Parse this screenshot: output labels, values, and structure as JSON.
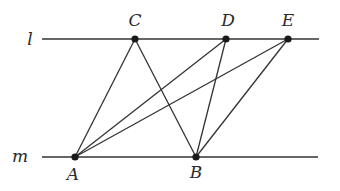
{
  "diagram": {
    "type": "geometry",
    "colors": {
      "stroke": "#333333",
      "point": "#1a1a1a",
      "label": "#2a2a2a",
      "background": "#ffffff"
    },
    "lines": [
      {
        "name": "l",
        "label": "l",
        "x1": 42,
        "y1": 39,
        "x2": 319,
        "y2": 39,
        "label_x": 30,
        "label_y": 45
      },
      {
        "name": "m",
        "label": "m",
        "x1": 42,
        "y1": 157,
        "x2": 318,
        "y2": 157,
        "label_x": 20,
        "label_y": 162
      }
    ],
    "points": [
      {
        "name": "C",
        "label": "C",
        "x": 135,
        "y": 39,
        "label_x": 135,
        "label_y": 26
      },
      {
        "name": "D",
        "label": "D",
        "x": 226,
        "y": 39,
        "label_x": 228,
        "label_y": 26
      },
      {
        "name": "E",
        "label": "E",
        "x": 288,
        "y": 39,
        "label_x": 288,
        "label_y": 26
      },
      {
        "name": "A",
        "label": "A",
        "x": 75,
        "y": 157,
        "label_x": 73,
        "label_y": 180
      },
      {
        "name": "B",
        "label": "B",
        "x": 196,
        "y": 157,
        "label_x": 196,
        "label_y": 178
      }
    ],
    "segments": [
      {
        "from": "A",
        "to": "C"
      },
      {
        "from": "A",
        "to": "D"
      },
      {
        "from": "A",
        "to": "E"
      },
      {
        "from": "B",
        "to": "C"
      },
      {
        "from": "B",
        "to": "D"
      },
      {
        "from": "B",
        "to": "E"
      }
    ]
  }
}
